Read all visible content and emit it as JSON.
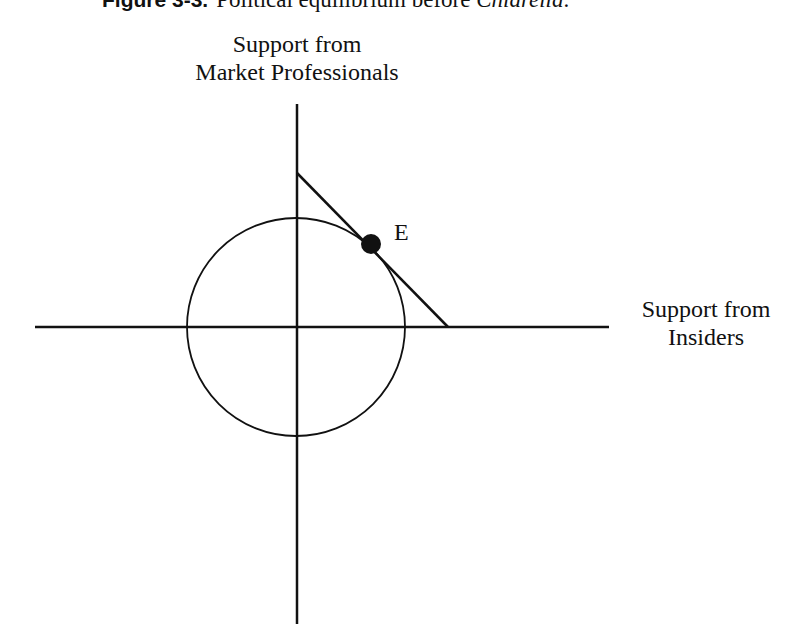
{
  "caption": {
    "figure_number": "Figure 3-3.",
    "text_before": "Political equilibrium before ",
    "case_name": "Chiarella",
    "text_after": "."
  },
  "axes": {
    "y_label_line1": "Support from",
    "y_label_line2": "Market Professionals",
    "x_label_line1": "Support from",
    "x_label_line2": "Insiders"
  },
  "equilibrium": {
    "label": "E"
  },
  "geometry": {
    "origin": [
      297,
      327
    ],
    "x_axis": {
      "x1": 35,
      "x2": 609,
      "y": 327
    },
    "y_axis": {
      "x": 297,
      "y1": 104,
      "y2": 624
    },
    "circle": {
      "cx": 296,
      "cy": 327,
      "r": 109
    },
    "constraint_line": {
      "x1": 297,
      "y1": 173,
      "x2": 448,
      "y2": 327
    },
    "point": {
      "cx": 371,
      "cy": 244,
      "r": 10
    },
    "stroke_color": "#111111"
  }
}
